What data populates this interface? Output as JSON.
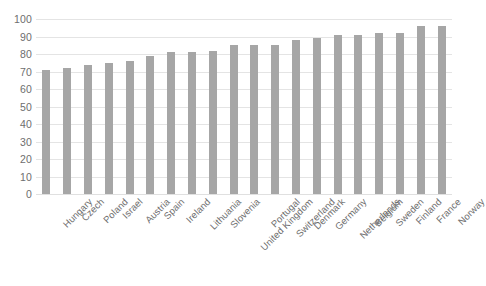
{
  "chart_data": {
    "type": "bar",
    "title": "",
    "subtitle": "",
    "xlabel": "",
    "ylabel": "",
    "ylim": [
      0,
      100
    ],
    "ytick_step": 10,
    "grid": true,
    "legend": false,
    "legend_position": "none",
    "bar_color": "#a6a6a6",
    "gridline_color": "#e4e4e4",
    "label_color": "#6e6e6e",
    "categories": [
      "Hungary",
      "Czech",
      "Poland",
      "Israel",
      "Austria",
      "Spain",
      "Ireland",
      "Lithuania",
      "Slovenia",
      "United Kingdom",
      "Portugal",
      "Switzerland",
      "Denmark",
      "Germany",
      "Netherlands",
      "Belgium",
      "Sweden",
      "Finland",
      "France",
      "Norway"
    ],
    "values": [
      71,
      72,
      74,
      75,
      76,
      79,
      81,
      81,
      82,
      85,
      85,
      85,
      88,
      89,
      91,
      91,
      92,
      92,
      96,
      96
    ],
    "yticks": [
      0,
      10,
      20,
      30,
      40,
      50,
      60,
      70,
      80,
      90,
      100
    ],
    "ytick_labels": [
      "0",
      "10",
      "20",
      "30",
      "40",
      "50",
      "60",
      "70",
      "80",
      "90",
      "100"
    ]
  }
}
